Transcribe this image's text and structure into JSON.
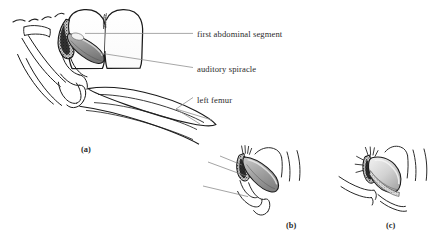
{
  "figure": {
    "type": "scientific-line-drawing",
    "background_color": "#ffffff",
    "ink_color": "#1a1a1a",
    "leader_line_color": "#7a7a7a",
    "shading_color": "#8a8a8a"
  },
  "annotations": [
    {
      "id": "first-abdominal-segment",
      "label": "first abdominal segment",
      "text_x": 197,
      "text_y": 30
    },
    {
      "id": "auditory-spiracle",
      "label": "auditory spiracle",
      "text_x": 197,
      "text_y": 65
    },
    {
      "id": "left-femur",
      "label": "left femur",
      "text_x": 197,
      "text_y": 96
    }
  ],
  "panels": [
    {
      "id": "panel-a",
      "label": "(a)",
      "x": 81,
      "y": 146
    },
    {
      "id": "panel-b",
      "label": "(b)",
      "x": 286,
      "y": 222
    },
    {
      "id": "panel-c",
      "label": "(c)",
      "x": 386,
      "y": 222
    }
  ]
}
